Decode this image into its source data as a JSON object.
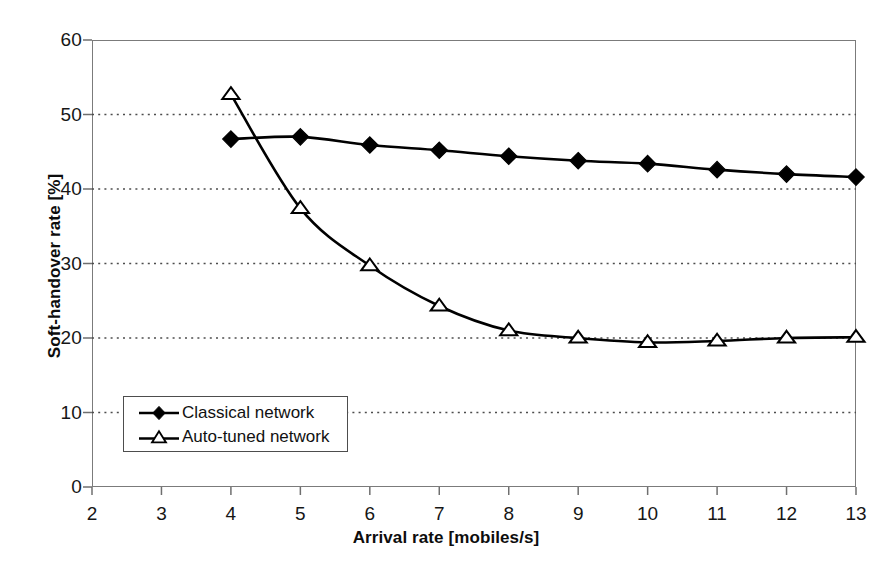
{
  "chart_data": {
    "type": "line",
    "title": "",
    "xlabel": "Arrival rate [mobiles/s]",
    "ylabel": "Soft-handover rate [%]",
    "xlim": [
      2,
      13
    ],
    "ylim": [
      0,
      60
    ],
    "x": [
      4,
      5,
      6,
      7,
      8,
      9,
      10,
      11,
      12,
      13
    ],
    "xticks": [
      "2",
      "3",
      "4",
      "5",
      "6",
      "7",
      "8",
      "9",
      "10",
      "11",
      "12",
      "13"
    ],
    "yticks": [
      "0",
      "10",
      "20",
      "30",
      "40",
      "50",
      "60"
    ],
    "grid": "horizontal-dotted",
    "legend_position": "inside-lower-left",
    "series": [
      {
        "name": "Classical network",
        "marker": "filled-diamond",
        "color": "#000000",
        "values": [
          46.7,
          47.0,
          45.9,
          45.2,
          44.4,
          43.8,
          43.4,
          42.6,
          42.0,
          41.6
        ]
      },
      {
        "name": "Auto-tuned network",
        "marker": "open-triangle",
        "color": "#000000",
        "values": [
          52.7,
          37.4,
          29.7,
          24.3,
          21.0,
          20.0,
          19.4,
          19.6,
          20.0,
          20.1
        ]
      }
    ]
  },
  "axes": {
    "x_title": "Arrival rate [mobiles/s]",
    "y_title": "Soft-handover rate [%]",
    "x_tick_labels": [
      "2",
      "3",
      "4",
      "5",
      "6",
      "7",
      "8",
      "9",
      "10",
      "11",
      "12",
      "13"
    ],
    "y_tick_labels": [
      "60",
      "50",
      "40",
      "30",
      "20",
      "10",
      "0"
    ]
  },
  "legend": {
    "items": [
      {
        "label": "Classical network",
        "marker": "filled-diamond"
      },
      {
        "label": "Auto-tuned network",
        "marker": "open-triangle"
      }
    ]
  }
}
